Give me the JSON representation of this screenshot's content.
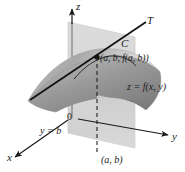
{
  "figure": {
    "background_color": "#ffffff",
    "ink_color": "#1a1a1a"
  },
  "axes": {
    "z_label": "z",
    "y_label": "y",
    "x_label": "x",
    "origin_label": "0"
  },
  "labels": {
    "tangent_line": "T",
    "curve": "C",
    "tangent_point": "(a, b, f(a, b))",
    "surface": "z = f(x, y)",
    "plane": "y = b",
    "base_point": "(a, b)"
  },
  "colors": {
    "plane_fill": "#d9d9d9",
    "surface_light": "#e6e6e6",
    "surface_mid": "#b8b8b8",
    "surface_dark": "#8f8f8f",
    "line": "#1a1a1a"
  },
  "geometry": {
    "z_axis": {
      "from": [
        72,
        118
      ],
      "to": [
        72,
        8
      ]
    },
    "y_axis": {
      "from": [
        72,
        118
      ],
      "to": [
        170,
        136
      ]
    },
    "x_axis": {
      "from": [
        72,
        118
      ],
      "to": [
        13,
        158
      ]
    },
    "tangent_line": {
      "from": [
        30,
        100
      ],
      "to": [
        146,
        22
      ]
    },
    "tangent_point": [
      97,
      57
    ],
    "dashed_drop": {
      "from": [
        97,
        57
      ],
      "to": [
        97,
        152
      ]
    },
    "plane_corners": [
      [
        68,
        22
      ],
      [
        135,
        37
      ],
      [
        135,
        148
      ],
      [
        68,
        133
      ]
    ]
  }
}
